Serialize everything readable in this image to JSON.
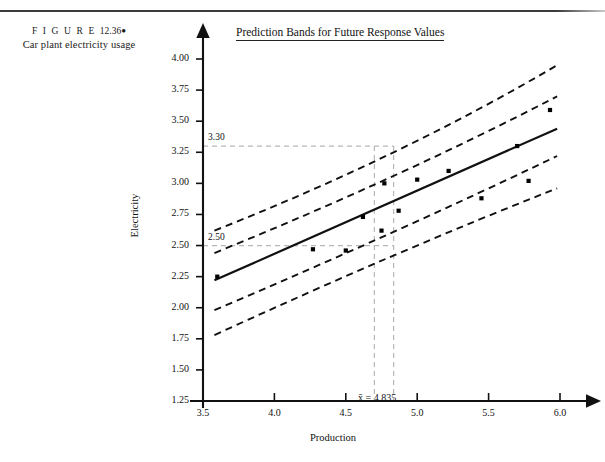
{
  "figure": {
    "label_prefix": "F I G U R E",
    "number": "12.36",
    "bullet": "●",
    "caption": "Car plant electricity usage"
  },
  "chart_title": "Prediction Bands for Future Response Values",
  "axes": {
    "xlabel": "Production",
    "ylabel": "Electricity"
  },
  "annotations": {
    "y_ref_high": "3.30",
    "y_ref_low": "2.50",
    "x_mean": "x̄ = 4.835",
    "x_mean_value": 4.835
  },
  "chart_data": {
    "type": "scatter",
    "title": "Prediction Bands for Future Response Values",
    "xlabel": "Production",
    "ylabel": "Electricity",
    "xlim": [
      3.5,
      6.0
    ],
    "ylim": [
      1.25,
      4.0
    ],
    "xticks": [
      "3.5",
      "4.0",
      "4.5",
      "5.0",
      "5.5",
      "6.0"
    ],
    "yticks": [
      "1.25",
      "1.50",
      "1.75",
      "2.00",
      "2.25",
      "2.50",
      "2.75",
      "3.00",
      "3.25",
      "3.50",
      "3.75",
      "4.00"
    ],
    "grid": false,
    "legend": null,
    "points": [
      {
        "x": 3.6,
        "y": 2.25
      },
      {
        "x": 4.27,
        "y": 2.47
      },
      {
        "x": 4.5,
        "y": 2.46
      },
      {
        "x": 4.62,
        "y": 2.73
      },
      {
        "x": 4.75,
        "y": 2.62
      },
      {
        "x": 4.77,
        "y": 3.0
      },
      {
        "x": 4.87,
        "y": 2.78
      },
      {
        "x": 5.0,
        "y": 3.03
      },
      {
        "x": 5.22,
        "y": 3.1
      },
      {
        "x": 5.45,
        "y": 2.88
      },
      {
        "x": 5.7,
        "y": 3.3
      },
      {
        "x": 5.78,
        "y": 3.02
      },
      {
        "x": 5.93,
        "y": 3.59
      }
    ],
    "regression_line": {
      "style": "solid",
      "x_start": 3.58,
      "y_start": 2.22,
      "x_end": 5.98,
      "y_end": 3.44
    },
    "bands": [
      {
        "name": "upper-outer-prediction-band",
        "style": "dashed",
        "x_start": 3.58,
        "y_start": 2.62,
        "x_mid": 4.835,
        "y_mid": 3.25,
        "x_end": 5.98,
        "y_end": 3.95
      },
      {
        "name": "upper-inner-prediction-band",
        "style": "dashed",
        "x_start": 3.58,
        "y_start": 2.44,
        "x_mid": 4.835,
        "y_mid": 3.06,
        "x_end": 5.98,
        "y_end": 3.7
      },
      {
        "name": "lower-inner-prediction-band",
        "style": "dashed",
        "x_start": 3.58,
        "y_start": 1.98,
        "x_mid": 4.835,
        "y_mid": 2.61,
        "x_end": 5.98,
        "y_end": 3.22
      },
      {
        "name": "lower-outer-prediction-band",
        "style": "dashed",
        "x_start": 3.58,
        "y_start": 1.78,
        "x_mid": 4.835,
        "y_mid": 2.42,
        "x_end": 5.98,
        "y_end": 2.96
      }
    ],
    "reference_lines": [
      {
        "name": "horizontal-ref-3.30",
        "orientation": "horizontal",
        "value": 3.3,
        "label": "3.30"
      },
      {
        "name": "horizontal-ref-2.50",
        "orientation": "horizontal",
        "value": 2.5,
        "label": "2.50"
      },
      {
        "name": "vertical-ref-left",
        "orientation": "vertical",
        "value": 4.7
      },
      {
        "name": "vertical-ref-mean",
        "orientation": "vertical",
        "value": 4.835
      }
    ]
  }
}
